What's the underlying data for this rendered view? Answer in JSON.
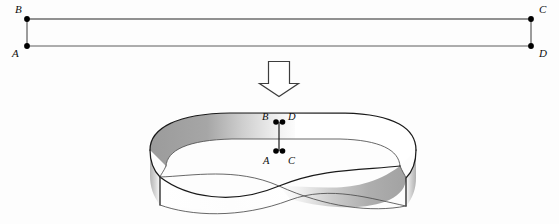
{
  "figure": {
    "background_color": "#fdfdfd",
    "ink_color": "#1a1a1a",
    "shade_color": "#9d9d9d"
  },
  "strip": {
    "description": "Flat rectangular strip with labeled corners",
    "corners": [
      {
        "id": "B",
        "label": "B",
        "x": 27,
        "y": 19,
        "label_x": 15,
        "label_y": 13
      },
      {
        "id": "C",
        "label": "C",
        "x": 531,
        "y": 19,
        "label_x": 539,
        "label_y": 13
      },
      {
        "id": "A",
        "label": "A",
        "x": 27,
        "y": 46,
        "label_x": 13,
        "label_y": 56
      },
      {
        "id": "D",
        "label": "D",
        "x": 531,
        "y": 46,
        "label_x": 539,
        "label_y": 56
      }
    ],
    "edges": [
      {
        "from": "B",
        "to": "C",
        "kind": "top"
      },
      {
        "from": "A",
        "to": "D",
        "kind": "bottom"
      },
      {
        "from": "B",
        "to": "A",
        "kind": "left-end"
      },
      {
        "from": "C",
        "to": "D",
        "kind": "right-end"
      }
    ]
  },
  "arrow": {
    "name": "downward-transform-arrow",
    "direction": "down",
    "x": 279,
    "y_top": 61,
    "y_bottom": 96
  },
  "band": {
    "description": "Mobius band formed by joining the strip ends with a half twist",
    "joined_pairs": [
      {
        "top": "B",
        "bottom": "D",
        "note": "B meets D"
      },
      {
        "top": "A",
        "bottom": "C",
        "note": "A meets C"
      }
    ],
    "labels": [
      {
        "id": "B",
        "label": "B",
        "label_x": 263,
        "label_y": 120,
        "dot_x": 276,
        "dot_y": 122
      },
      {
        "id": "D",
        "label": "D",
        "label_x": 288,
        "label_y": 120,
        "dot_x": 282,
        "dot_y": 122
      },
      {
        "id": "A",
        "label": "A",
        "label_x": 265,
        "label_y": 163,
        "dot_x": 276,
        "dot_y": 151
      },
      {
        "id": "C",
        "label": "C",
        "label_x": 288,
        "label_y": 163,
        "dot_x": 282,
        "dot_y": 151
      }
    ],
    "seam": {
      "x": 279,
      "y_top": 122,
      "y_bottom": 151
    }
  }
}
